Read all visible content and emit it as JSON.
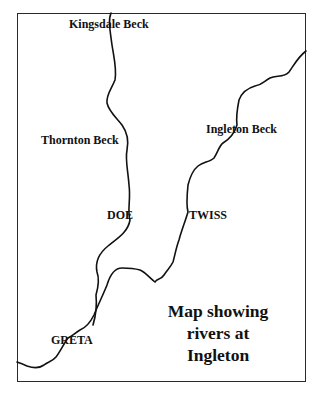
{
  "map": {
    "title_lines": [
      "Map showing",
      "rivers at",
      "Ingleton"
    ],
    "labels": {
      "kingsdale_beck": "Kingsdale Beck",
      "thornton_beck": "Thornton Beck",
      "ingleton_beck": "Ingleton Beck",
      "doe": "DOE",
      "twiss": "TWISS",
      "greta": "GRETA"
    },
    "colors": {
      "river": "#111111",
      "frame": "#2a2a2a",
      "background": "#ffffff"
    }
  }
}
